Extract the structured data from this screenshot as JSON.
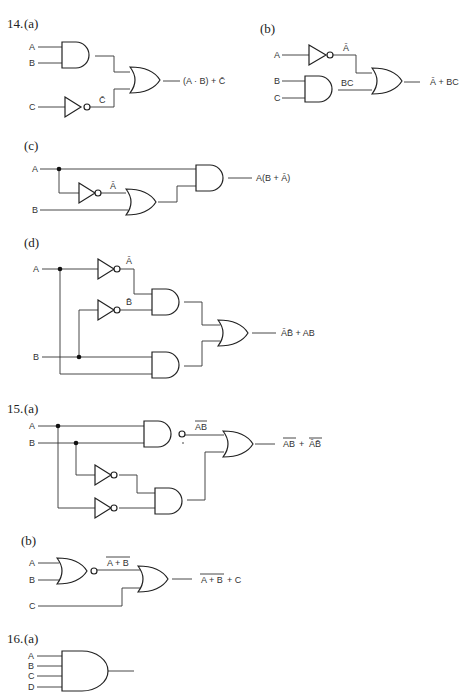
{
  "problems": [
    {
      "number": "14.",
      "parts": [
        {
          "label": "(a)",
          "inputs": [
            "A",
            "B",
            "C"
          ],
          "intermediate": [
            "C̄"
          ],
          "output": "(A · B) + C̄"
        },
        {
          "label": "(b)",
          "inputs": [
            "A",
            "B",
            "C"
          ],
          "intermediate": [
            "Ā",
            "BC"
          ],
          "output": "Ā + BC"
        },
        {
          "label": "(c)",
          "inputs": [
            "A",
            "B"
          ],
          "intermediate": [
            "Ā"
          ],
          "output": "A(B + Ā)"
        },
        {
          "label": "(d)",
          "inputs": [
            "A",
            "B"
          ],
          "intermediate": [
            "Ā",
            "B̄"
          ],
          "output": "ĀB̄ + AB"
        }
      ]
    },
    {
      "number": "15.",
      "parts": [
        {
          "label": "(a)",
          "inputs": [
            "A",
            "B"
          ],
          "intermediate": [
            "AB"
          ],
          "output_terms": [
            "AB",
            "ĀB̄"
          ],
          "output_plus": "+"
        },
        {
          "label": "(b)",
          "inputs": [
            "A",
            "B",
            "C"
          ],
          "intermediate": [
            "A + B"
          ],
          "output_main": "A + B",
          "output_tail": "+ C"
        }
      ]
    },
    {
      "number": "16.",
      "parts": [
        {
          "label": "(a)",
          "inputs": [
            "A",
            "B",
            "C",
            "D"
          ]
        }
      ]
    }
  ]
}
